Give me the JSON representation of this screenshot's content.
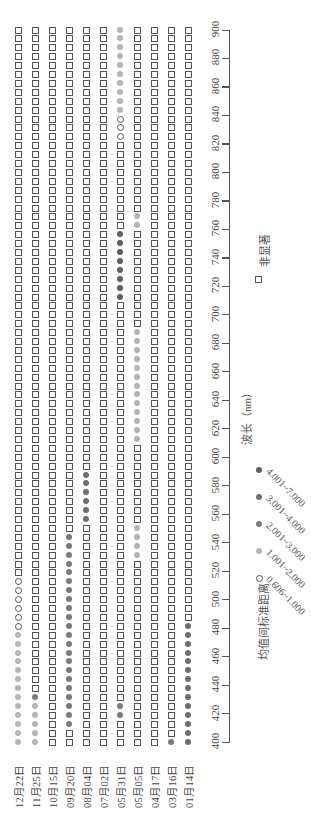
{
  "chart_data": {
    "type": "scatter",
    "title": "",
    "orientation": "rotated-90",
    "xlabel": "波长（nm）",
    "ylabel": "",
    "xlim": [
      400,
      900
    ],
    "x_ticks": [
      400,
      420,
      440,
      460,
      480,
      500,
      520,
      540,
      560,
      580,
      600,
      620,
      640,
      660,
      680,
      700,
      720,
      740,
      760,
      780,
      800,
      820,
      840,
      860,
      880,
      900
    ],
    "wavelength_step_nm": 6.25,
    "n_bands": 81,
    "categories": [
      "12月22日",
      "11月25日",
      "10月15日",
      "09月20日",
      "08月04日",
      "07月02日",
      "05月31日",
      "05月05日",
      "04月17日",
      "03月16日",
      "01月14日"
    ],
    "legend": {
      "title": "均值间标准距离",
      "entries": [
        {
          "key": "c1",
          "label": "0.606~1.000",
          "marker": "open-circle",
          "color": "#555555"
        },
        {
          "key": "c2",
          "label": "1.001~2.000",
          "marker": "filled-circle",
          "color": "#b4b4b4"
        },
        {
          "key": "c3",
          "label": "2.001~3.000",
          "marker": "filled-circle",
          "color": "#7a7a7a"
        },
        {
          "key": "c4",
          "label": "3.001~4.000",
          "marker": "filled-circle",
          "color": "#6e6e6e"
        },
        {
          "key": "c5",
          "label": "4.001~7.000",
          "marker": "filled-circle",
          "color": "#5f5f5f"
        }
      ],
      "nonsig": {
        "key": "ns",
        "label": "非显著",
        "marker": "open-square",
        "color": "#555555"
      }
    },
    "series": [
      {
        "name": "12月22日",
        "segments": [
          {
            "from_nm": 400,
            "to_nm": 475,
            "class": "c2"
          },
          {
            "from_nm": 481.25,
            "to_nm": 512.5,
            "class": "c1"
          }
        ]
      },
      {
        "name": "11月25日",
        "segments": [
          {
            "from_nm": 400,
            "to_nm": 425,
            "class": "c2"
          },
          {
            "from_nm": 431.25,
            "to_nm": 431.25,
            "class": "c3"
          }
        ]
      },
      {
        "name": "10月15日",
        "segments": []
      },
      {
        "name": "09月20日",
        "segments": [
          {
            "from_nm": 412.5,
            "to_nm": 543.75,
            "class": "c3"
          }
        ]
      },
      {
        "name": "08月04日",
        "segments": [
          {
            "from_nm": 556.25,
            "to_nm": 587.5,
            "class": "c4"
          }
        ]
      },
      {
        "name": "07月02日",
        "segments": []
      },
      {
        "name": "05月31日",
        "segments": [
          {
            "from_nm": 418.75,
            "to_nm": 425,
            "class": "c3"
          },
          {
            "from_nm": 712.5,
            "to_nm": 756.25,
            "class": "c5"
          },
          {
            "from_nm": 825,
            "to_nm": 837.5,
            "class": "c1"
          },
          {
            "from_nm": 843.75,
            "to_nm": 900,
            "class": "c2"
          }
        ]
      },
      {
        "name": "05月05日",
        "segments": [
          {
            "from_nm": 531.25,
            "to_nm": 550,
            "class": "c2"
          },
          {
            "from_nm": 612.5,
            "to_nm": 687.5,
            "class": "c2"
          },
          {
            "from_nm": 762.5,
            "to_nm": 768.75,
            "class": "c2"
          }
        ]
      },
      {
        "name": "04月17日",
        "segments": []
      },
      {
        "name": "03月16日",
        "segments": [
          {
            "from_nm": 400,
            "to_nm": 400,
            "class": "c3"
          }
        ]
      },
      {
        "name": "01月14日",
        "segments": [
          {
            "from_nm": 400,
            "to_nm": 481.25,
            "class": "c4"
          }
        ]
      }
    ],
    "default_class": "ns",
    "grid": false,
    "legend_position": "right"
  }
}
